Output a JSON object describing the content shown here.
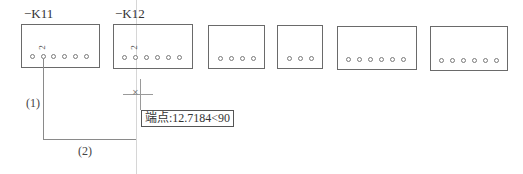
{
  "components": [
    {
      "tag": "−K11",
      "pins": 6,
      "highlight_pin_label": "2"
    },
    {
      "tag": "−K12",
      "pins": 6,
      "highlight_pin_label": "2"
    },
    {
      "tag": "",
      "pins": 4
    },
    {
      "tag": "",
      "pins": 3
    },
    {
      "tag": "",
      "pins": 6
    },
    {
      "tag": "",
      "pins": 6
    }
  ],
  "wire": {
    "segment1_label": "(1)",
    "segment2_label": "(2)"
  },
  "cursor": {
    "snap_tooltip": "端点:12.7184<90"
  },
  "colors": {
    "line": "#6a6a6a",
    "tracking": "#d6d6d6",
    "background": "#ffffff"
  }
}
